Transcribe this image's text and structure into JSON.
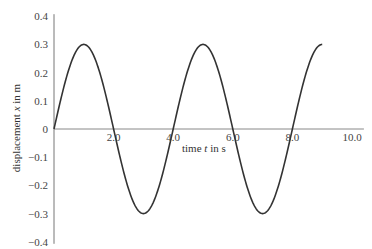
{
  "chart_data": {
    "type": "line",
    "title": "",
    "xlabel": "time t in s",
    "ylabel": "displacement x in m",
    "xlim": [
      0,
      10
    ],
    "ylim": [
      -0.4,
      0.4
    ],
    "grid": false,
    "legend": null,
    "x_ticks": [
      "2.0",
      "4.0",
      "6.0",
      "8.0",
      "10.0"
    ],
    "y_ticks": [
      "0.4",
      "0.3",
      "0.2",
      "0.1",
      "0",
      "-0.1",
      "-0.2",
      "-0.3",
      "-0.4"
    ],
    "series": [
      {
        "name": "displacement",
        "function": "x = 0.3 sin(2*pi*t/4)",
        "amplitude": 0.3,
        "period": 4.0,
        "x": [
          0,
          0.5,
          1.0,
          1.5,
          2.0,
          2.5,
          3.0,
          3.5,
          4.0,
          4.5,
          5.0,
          5.5,
          6.0,
          6.5,
          7.0,
          7.5,
          8.0,
          8.5,
          9.0
        ],
        "values": [
          0,
          0.212,
          0.3,
          0.212,
          0,
          -0.212,
          -0.3,
          -0.212,
          0,
          0.212,
          0.3,
          0.212,
          0,
          -0.212,
          -0.3,
          -0.212,
          0,
          0.212,
          0.3
        ]
      }
    ]
  },
  "labels": {
    "xlabel": "time t in s",
    "ylabel": "displacement x in m"
  }
}
